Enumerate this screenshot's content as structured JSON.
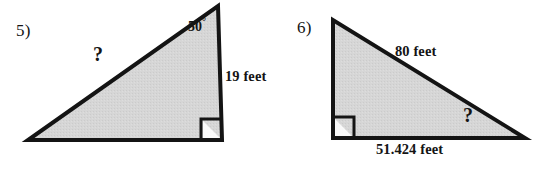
{
  "page": {
    "background_color": "#ffffff",
    "ink_color": "#141414",
    "fill_color": "#d4d4d4",
    "type": "geometry-worksheet-problems"
  },
  "problems": [
    {
      "number_label": "5)",
      "shape": "right-triangle",
      "right_angle_position": "bottom-right",
      "labels": {
        "angle_value": "50",
        "angle_degree_symbol": "°",
        "hypotenuse": "?",
        "vertical_leg": "19 feet"
      },
      "geometry": {
        "vertices": [
          [
            28,
            140
          ],
          [
            222,
            140
          ],
          [
            218,
            6
          ]
        ],
        "right_angle_marker": [
          [
            222,
            140
          ],
          [
            201,
            140
          ],
          [
            201,
            119
          ],
          [
            222,
            119
          ]
        ]
      }
    },
    {
      "number_label": "6)",
      "shape": "right-triangle",
      "right_angle_position": "bottom-left",
      "labels": {
        "hypotenuse": "80 feet",
        "base": "51.424 feet",
        "angle": "?"
      },
      "geometry": {
        "vertices": [
          [
            60,
            20
          ],
          [
            60,
            138
          ],
          [
            252,
            138
          ]
        ],
        "right_angle_marker": [
          [
            60,
            138
          ],
          [
            60,
            117
          ],
          [
            81,
            117
          ],
          [
            81,
            138
          ]
        ]
      }
    }
  ]
}
